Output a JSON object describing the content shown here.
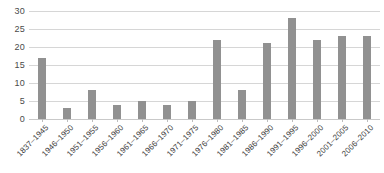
{
  "chart_data": {
    "type": "bar",
    "title": "",
    "subtitle": "",
    "xlabel": "",
    "ylabel": "",
    "categories": [
      "1837–1945",
      "1946–1950",
      "1951–1955",
      "1956–1960",
      "1961–1965",
      "1966–1970",
      "1971–1975",
      "1976–1980",
      "1981–1985",
      "1986–1990",
      "1991–1995",
      "1996–2000",
      "2001–2005",
      "2006–2010"
    ],
    "values": [
      17,
      3,
      8,
      4,
      5,
      4,
      5,
      22,
      8,
      21,
      28,
      22,
      23,
      23
    ],
    "ylim": [
      0,
      30
    ],
    "ytick_values": [
      0,
      5,
      10,
      15,
      20,
      25,
      30
    ],
    "ytick_labels": [
      "0",
      "5",
      "10",
      "15",
      "20",
      "25",
      "30"
    ],
    "grid": "horizontal",
    "legend": "none",
    "bar_color": "#919191",
    "gridline_color": "#d6d6d6",
    "background_color": "#ffffff",
    "annotations": []
  }
}
